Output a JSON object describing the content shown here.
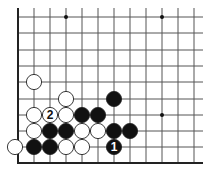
{
  "diagram": {
    "type": "go-board-fragment",
    "corner": "bottom-left",
    "grid": {
      "columns_x": [
        18,
        34,
        50,
        66,
        82,
        98,
        114,
        130,
        146,
        162,
        178,
        194
      ],
      "rows_y": [
        17,
        33,
        50,
        66,
        82,
        99,
        115,
        131,
        147
      ],
      "edge_bottom_y": 163,
      "edge_left_x": 18,
      "line_top_y": 8,
      "line_right_x": 203,
      "line_color": "#555555",
      "edge_color": "#222222"
    },
    "star_points": [
      {
        "col": 3,
        "row": 0
      },
      {
        "col": 9,
        "row": 0
      },
      {
        "col": 9,
        "row": 6
      }
    ],
    "stones": [
      {
        "color": "white",
        "col": 1,
        "row": 4
      },
      {
        "color": "white",
        "col": 3,
        "row": 5
      },
      {
        "color": "black",
        "col": 6,
        "row": 5
      },
      {
        "color": "white",
        "col": 1,
        "row": 6
      },
      {
        "color": "white",
        "col": 2,
        "row": 6,
        "label": "2"
      },
      {
        "color": "white",
        "col": 3,
        "row": 6
      },
      {
        "color": "black",
        "col": 4,
        "row": 6
      },
      {
        "color": "black",
        "col": 5,
        "row": 6
      },
      {
        "color": "white",
        "col": 1,
        "row": 7
      },
      {
        "color": "black",
        "col": 2,
        "row": 7
      },
      {
        "color": "black",
        "col": 3,
        "row": 7
      },
      {
        "color": "white",
        "col": 4,
        "row": 7
      },
      {
        "color": "white",
        "col": 5,
        "row": 7
      },
      {
        "color": "black",
        "col": 6,
        "row": 7
      },
      {
        "color": "black",
        "col": 7,
        "row": 7
      },
      {
        "color": "white",
        "col": 0,
        "row": 8,
        "x_offset": -3
      },
      {
        "color": "black",
        "col": 1,
        "row": 8
      },
      {
        "color": "black",
        "col": 2,
        "row": 8
      },
      {
        "color": "white",
        "col": 3,
        "row": 8
      },
      {
        "color": "white",
        "col": 4,
        "row": 8
      },
      {
        "color": "black",
        "col": 6,
        "row": 8,
        "label": "1"
      }
    ],
    "move_labels": {
      "move_1": "1",
      "move_2": "2"
    }
  }
}
